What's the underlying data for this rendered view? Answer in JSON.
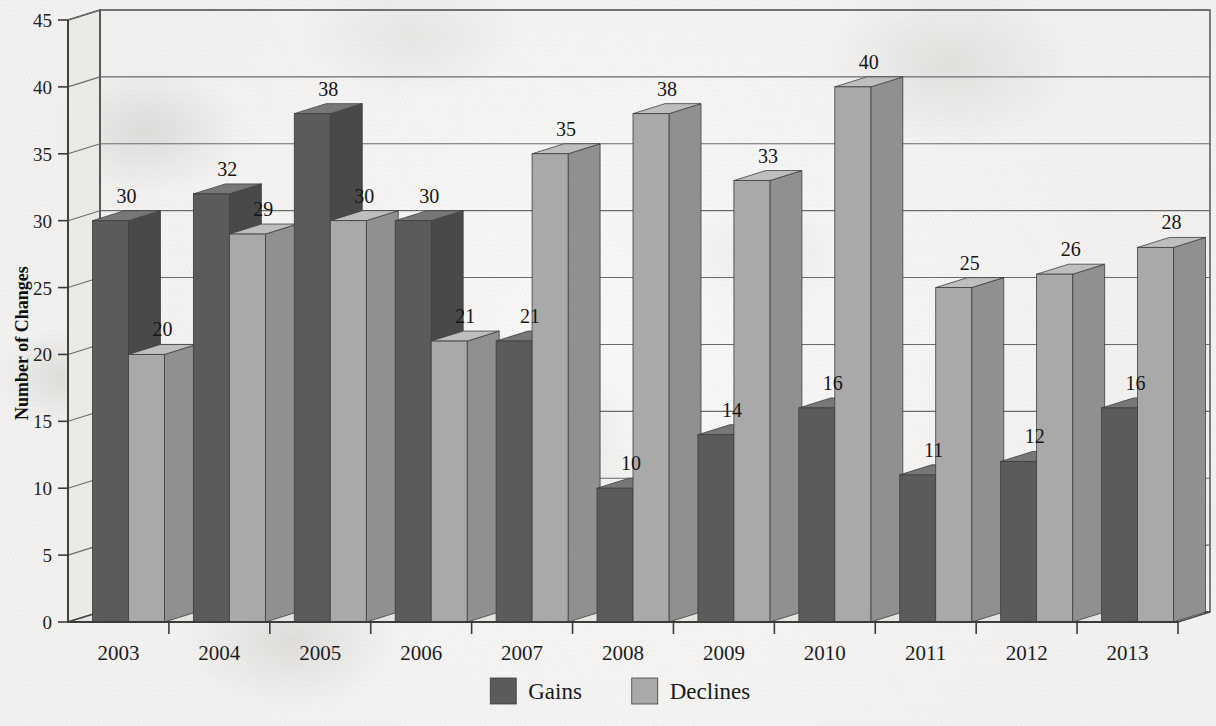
{
  "chart_data": {
    "type": "bar",
    "title": "",
    "xlabel": "",
    "ylabel": "Number of Changes",
    "categories": [
      "2003",
      "2004",
      "2005",
      "2006",
      "2007",
      "2008",
      "2009",
      "2010",
      "2011",
      "2012",
      "2013"
    ],
    "series": [
      {
        "name": "Gains",
        "color": "#5b5b5b",
        "values": [
          30,
          32,
          38,
          30,
          21,
          10,
          14,
          16,
          11,
          12,
          16
        ]
      },
      {
        "name": "Declines",
        "color": "#a9a9a9",
        "values": [
          20,
          29,
          30,
          21,
          35,
          38,
          33,
          40,
          25,
          26,
          28
        ]
      }
    ],
    "ylim": [
      0,
      45
    ],
    "ytick_step": 5,
    "ytick_labels": [
      "0",
      "5",
      "10",
      "15",
      "20",
      "25",
      "30",
      "35",
      "40",
      "45"
    ],
    "grid": true,
    "grid_axis": "y",
    "legend_position": "bottom-center",
    "three_d": true,
    "value_labels": true
  },
  "axis": {
    "y_title": "Number of Changes",
    "ticks": [
      "45",
      "40",
      "35",
      "30",
      "25",
      "20",
      "15",
      "10",
      "5",
      "0"
    ]
  },
  "categories": [
    "2003",
    "2004",
    "2005",
    "2006",
    "2007",
    "2008",
    "2009",
    "2010",
    "2011",
    "2012",
    "2013"
  ],
  "legend": {
    "items": [
      {
        "label": "Gains",
        "swatch_color": "#5b5b5b"
      },
      {
        "label": "Declines",
        "swatch_color": "#a9a9a9"
      }
    ]
  },
  "value_labels": {
    "gains": [
      "30",
      "32",
      "38",
      "30",
      "21",
      "10",
      "14",
      "16",
      "11",
      "12",
      "16"
    ],
    "declines": [
      "20",
      "29",
      "30",
      "21",
      "35",
      "38",
      "33",
      "40",
      "25",
      "26",
      "28"
    ]
  },
  "colors": {
    "gains_front": "#5b5b5b",
    "gains_top": "#777777",
    "gains_side": "#494949",
    "declines_front": "#a9a9a9",
    "declines_top": "#bebebe",
    "declines_side": "#909090",
    "gridline": "#6a6a6a",
    "frame": "#4a4a4a",
    "paper": "#f3f2f0",
    "wall": "#e8e7e4",
    "floor": "#e3e2df"
  }
}
